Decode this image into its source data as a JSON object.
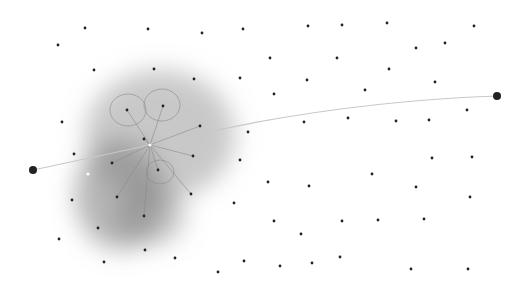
{
  "diagram": {
    "background": "#ffffff",
    "start_point": {
      "x": 33,
      "y": 170,
      "r": 4
    },
    "end_point": {
      "x": 497,
      "y": 96,
      "r": 4
    },
    "path": {
      "color": "#c8c8c8",
      "d": "M33,170 L150,145 C260,118 380,100 497,96"
    },
    "hub": {
      "x": 150,
      "y": 145
    },
    "spokes": [
      [
        127,
        110
      ],
      [
        163,
        106
      ],
      [
        200,
        126
      ],
      [
        193,
        156
      ],
      [
        191,
        194
      ],
      [
        144,
        216
      ],
      [
        117,
        197
      ],
      [
        112,
        163
      ],
      [
        158,
        170
      ],
      [
        144,
        139
      ]
    ],
    "loops": [
      {
        "cx": 128,
        "cy": 110,
        "rx": 18,
        "ry": 16
      },
      {
        "cx": 162,
        "cy": 105,
        "rx": 18,
        "ry": 16
      },
      {
        "cx": 160,
        "cy": 172,
        "rx": 14,
        "ry": 12
      }
    ],
    "blobs": [
      {
        "cx": 160,
        "cy": 135,
        "rx": 75,
        "ry": 65,
        "color": "#9a9a9a",
        "opacity": 0.55
      },
      {
        "cx": 120,
        "cy": 195,
        "rx": 45,
        "ry": 55,
        "color": "#7a7a7a",
        "opacity": 0.55
      },
      {
        "cx": 150,
        "cy": 215,
        "rx": 35,
        "ry": 30,
        "color": "#808080",
        "opacity": 0.45
      }
    ],
    "points": [
      [
        85,
        28
      ],
      [
        148,
        29
      ],
      [
        202,
        33
      ],
      [
        243,
        29
      ],
      [
        58,
        45
      ],
      [
        94,
        70
      ],
      [
        154,
        69
      ],
      [
        194,
        79
      ],
      [
        240,
        78
      ],
      [
        62,
        122
      ],
      [
        248,
        132
      ],
      [
        144,
        139
      ],
      [
        308,
        26
      ],
      [
        342,
        25
      ],
      [
        387,
        23
      ],
      [
        474,
        26
      ],
      [
        416,
        48
      ],
      [
        445,
        43
      ],
      [
        270,
        58
      ],
      [
        337,
        58
      ],
      [
        389,
        69
      ],
      [
        307,
        80
      ],
      [
        435,
        82
      ],
      [
        274,
        94
      ],
      [
        365,
        90
      ],
      [
        304,
        122
      ],
      [
        348,
        118
      ],
      [
        396,
        121
      ],
      [
        429,
        120
      ],
      [
        467,
        110
      ],
      [
        74,
        154
      ],
      [
        112,
        163
      ],
      [
        158,
        170
      ],
      [
        117,
        197
      ],
      [
        191,
        194
      ],
      [
        144,
        216
      ],
      [
        72,
        200
      ],
      [
        98,
        228
      ],
      [
        59,
        239
      ],
      [
        145,
        250
      ],
      [
        175,
        258
      ],
      [
        104,
        262
      ],
      [
        218,
        272
      ],
      [
        244,
        261
      ],
      [
        240,
        160
      ],
      [
        234,
        203
      ],
      [
        127,
        110
      ],
      [
        163,
        106
      ],
      [
        200,
        126
      ],
      [
        193,
        156
      ],
      [
        432,
        158
      ],
      [
        472,
        157
      ],
      [
        372,
        174
      ],
      [
        268,
        182
      ],
      [
        309,
        186
      ],
      [
        416,
        187
      ],
      [
        470,
        197
      ],
      [
        274,
        221
      ],
      [
        342,
        221
      ],
      [
        378,
        220
      ],
      [
        424,
        219
      ],
      [
        301,
        234
      ],
      [
        340,
        257
      ],
      [
        280,
        266
      ],
      [
        312,
        263
      ],
      [
        411,
        269
      ],
      [
        468,
        269
      ]
    ],
    "point_color": "#222222",
    "white_marks": [
      [
        150,
        145
      ],
      [
        88,
        174
      ]
    ]
  }
}
